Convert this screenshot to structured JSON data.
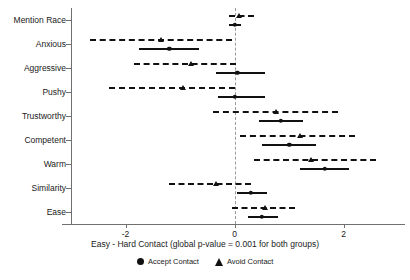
{
  "chart_data": {
    "type": "scatter",
    "title": "",
    "subtitle": "",
    "xlabel": "Easy - Hard Contact (global p-value = 0.001 for both groups)",
    "ylabel": "",
    "xlim": [
      -3.0,
      3.05
    ],
    "xticks": [
      -2,
      0,
      2
    ],
    "xticklabels": [
      "-2",
      "0",
      "2"
    ],
    "grid": false,
    "zero_reference_line": 0,
    "legend_position": "bottom-center",
    "legend": [
      "Accept Contact",
      "Avoid Contact"
    ],
    "categories": [
      "Mention Race",
      "Anxious",
      "Aggressive",
      "Pushy",
      "Trustworthy",
      "Competent",
      "Warm",
      "Similarity",
      "Ease"
    ],
    "series": [
      {
        "name": "Accept Contact",
        "marker": "circle",
        "interval_style": "solid",
        "values": [
          0.0,
          -1.2,
          0.05,
          0.0,
          0.85,
          1.0,
          1.65,
          0.3,
          0.5
        ],
        "ci_low": [
          -0.1,
          -1.75,
          -0.35,
          -0.3,
          0.45,
          0.5,
          1.2,
          0.05,
          0.25
        ],
        "ci_high": [
          0.12,
          -0.65,
          0.55,
          0.55,
          1.25,
          1.5,
          2.1,
          0.6,
          0.8
        ]
      },
      {
        "name": "Avoid Contact",
        "marker": "triangle",
        "interval_style": "dashed",
        "values": [
          0.08,
          -1.35,
          -0.8,
          -0.95,
          0.75,
          1.2,
          1.4,
          -0.35,
          0.55
        ],
        "ci_low": [
          -0.1,
          -2.65,
          -1.85,
          -2.3,
          -0.4,
          0.1,
          0.35,
          -1.2,
          -0.05
        ],
        "ci_high": [
          0.35,
          -0.05,
          0.02,
          0.0,
          1.9,
          2.2,
          2.6,
          0.3,
          1.1
        ]
      }
    ]
  },
  "axis": {
    "x_title": "Easy - Hard Contact (global p-value = 0.001 for both groups)"
  },
  "legend": {
    "items": [
      {
        "label": "Accept Contact",
        "glyph": "filled-circle"
      },
      {
        "label": "Avoid Contact",
        "glyph": "filled-triangle"
      }
    ]
  }
}
